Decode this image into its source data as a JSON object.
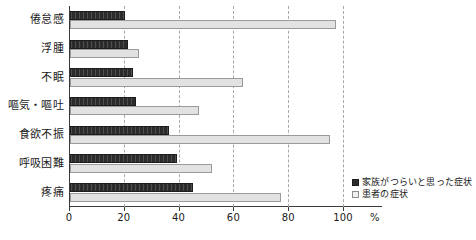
{
  "chart_data": {
    "type": "bar",
    "orientation": "horizontal",
    "title": "",
    "xlabel": "%",
    "ylabel": "",
    "xlim": [
      0,
      100
    ],
    "xticks": [
      0,
      20,
      40,
      60,
      80,
      100
    ],
    "xtick_labels": [
      "0",
      "20",
      "40",
      "60",
      "80",
      "100"
    ],
    "unit_label": "%",
    "grid": "vertical-dashed",
    "legend_position": "bottom-right",
    "categories": [
      "倦怠感",
      "浮腫",
      "不眠",
      "嘔気・嘔吐",
      "食欲不振",
      "呼吸困難",
      "疼痛"
    ],
    "series": [
      {
        "name": "家族がつらいと思った症状",
        "color": "#2b2b2b",
        "values": [
          20,
          21,
          23,
          24,
          36,
          39,
          45
        ]
      },
      {
        "name": "患者の症状",
        "color": "#e2e2e2",
        "values": [
          97,
          25,
          63,
          47,
          95,
          52,
          77
        ]
      }
    ]
  },
  "legend": {
    "items": [
      {
        "label": "家族がつらいと思った症状",
        "swatch": "dark"
      },
      {
        "label": "患者の症状",
        "swatch": "light"
      }
    ]
  },
  "axis": {
    "unit": "%"
  }
}
